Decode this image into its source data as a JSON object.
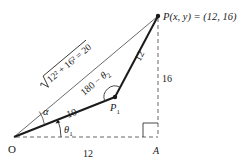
{
  "diagram": {
    "type": "geometry",
    "colors": {
      "ink": "#1a1a1a",
      "thin": "#444444",
      "dash": "#666666",
      "background": "#ffffff"
    },
    "points": {
      "O": {
        "label": "O"
      },
      "P1": {
        "label_main": "P",
        "label_sub": "1"
      },
      "P": {
        "label": "P(x, y) = (12, 16)"
      },
      "A": {
        "label": "A"
      }
    },
    "segments": {
      "O_P1": {
        "length_label": "10"
      },
      "P1_P": {
        "length_label": "12"
      },
      "O_P": {
        "length_label": "√(12² + 16²) = 20",
        "rad_body": "12² + 16² = 20"
      },
      "O_A": {
        "length_label": "12"
      },
      "A_P": {
        "length_label": "16"
      }
    },
    "angles": {
      "alpha": {
        "label": "α"
      },
      "theta1": {
        "label_main": "θ",
        "label_sub": "1"
      },
      "theta2_supp": {
        "label_prefix": "180 − ",
        "label_main": "θ",
        "label_sub": "2"
      }
    }
  }
}
